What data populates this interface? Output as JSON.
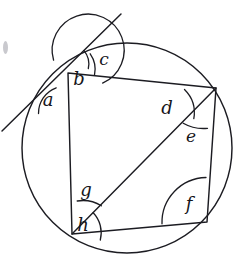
{
  "figure": {
    "background_color": "#ffffff",
    "ink_color": "#1c1c22",
    "circle": {
      "cx": 127,
      "cy": 148,
      "r": 105
    },
    "vertices": {
      "top_left": {
        "name": "A",
        "x": 68,
        "y": 73
      },
      "top_right": {
        "name": "B",
        "x": 216,
        "y": 88
      },
      "bottom_right": {
        "name": "C",
        "x": 207,
        "y": 222
      },
      "bottom_left": {
        "name": "D",
        "x": 72,
        "y": 234
      }
    },
    "quadrilateral_path": "M68,73 L216,88 L207,222 L72,234 Z",
    "diagonal_path": "M72,234 L216,88",
    "tangent_line": {
      "x1": 2,
      "y1": 131,
      "x2": 121,
      "y2": 14
    },
    "edge_smudge": {
      "x": 3,
      "y": 41,
      "w": 5,
      "h": 13
    },
    "angle_arcs": [
      {
        "id": "arc-a",
        "d": "M38.5,113.5 A27,27 0 0 1 56.2,87.8"
      },
      {
        "id": "arc-b",
        "d": "M53.6,60.2 A36,36 0 1 1 102.6,83.1"
      },
      {
        "id": "arc-c",
        "d": "M90.2,53.8 A27,27 0 0 1 94.5,75.1"
      },
      {
        "id": "arc-c-inner",
        "d": "M84.0,50.6 A21,21 0 0 1 88.3,68.5"
      },
      {
        "id": "arc-d",
        "d": "M184.5,89.5 A33,33 0 0 1 193.8,118.7"
      },
      {
        "id": "arc-e",
        "d": "M183.2,123.2 A41,41 0 0 0 207.5,128.3"
      },
      {
        "id": "arc-f",
        "d": "M162.0,223.8 A45,45 0 0 1 206.0,177.5"
      },
      {
        "id": "arc-g",
        "d": "M77.2,201.0 A35,35 0 0 1 101.4,205.8"
      },
      {
        "id": "arc-h",
        "d": "M100.3,240.0 A29,29 0 0 0 93.2,212.8"
      }
    ],
    "labels": [
      {
        "key": "a",
        "text": "a",
        "x": 48,
        "y": 106,
        "size": 18
      },
      {
        "key": "b",
        "text": "b",
        "x": 79,
        "y": 85,
        "size": 18
      },
      {
        "key": "c",
        "text": "c",
        "x": 104,
        "y": 65,
        "size": 17
      },
      {
        "key": "d",
        "text": "d",
        "x": 167,
        "y": 114,
        "size": 18
      },
      {
        "key": "e",
        "text": "e",
        "x": 191,
        "y": 142,
        "size": 17
      },
      {
        "key": "f",
        "text": "f",
        "x": 189,
        "y": 210,
        "size": 18
      },
      {
        "key": "g",
        "text": "g",
        "x": 86,
        "y": 196,
        "size": 18
      },
      {
        "key": "h",
        "text": "h",
        "x": 83,
        "y": 231,
        "size": 18
      }
    ]
  }
}
